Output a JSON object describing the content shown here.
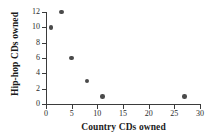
{
  "chart_data": {
    "type": "scatter",
    "title": "",
    "xlabel": "Country CDs owned",
    "ylabel": "Hip-hop CDs owned",
    "xlim": [
      0,
      30
    ],
    "ylim": [
      0,
      12
    ],
    "xticks": [
      0,
      5,
      10,
      15,
      20,
      25,
      30
    ],
    "yticks": [
      0,
      2,
      4,
      6,
      8,
      10,
      12
    ],
    "grid": false,
    "legend": null,
    "marker_color": "#4a4a4a",
    "axis_color": "#3b3b3b",
    "background_color": "#ffffff",
    "points": [
      {
        "x": 1,
        "y": 10
      },
      {
        "x": 3,
        "y": 12
      },
      {
        "x": 5,
        "y": 6
      },
      {
        "x": 8,
        "y": 3
      },
      {
        "x": 11,
        "y": 1
      },
      {
        "x": 27,
        "y": 1
      }
    ]
  }
}
